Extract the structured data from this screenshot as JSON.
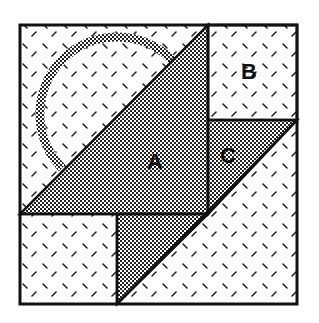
{
  "diagram": {
    "type": "quilt-block-geometry",
    "labels": {
      "a": "A",
      "b": "B",
      "c": "C"
    },
    "colors": {
      "outline": "#111111",
      "background": "#ffffff",
      "dots": "#222222",
      "dashes": "#222222"
    },
    "regions": [
      {
        "id": "A",
        "fill": "dotted",
        "shape": "triangle"
      },
      {
        "id": "B",
        "fill": "dashed",
        "shape": "square"
      },
      {
        "id": "C",
        "fill": "dotted",
        "shape": "triangle"
      }
    ]
  }
}
